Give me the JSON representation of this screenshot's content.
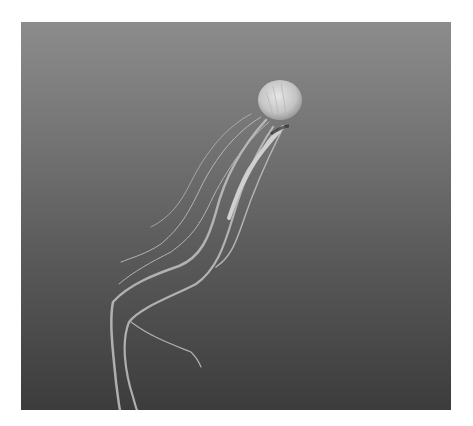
{
  "image": {
    "subject": "jellyfish",
    "alt": "A jellyfish with long trailing tentacles drifting in dark water, grayscale",
    "colors": {
      "background": "#ffffff",
      "water_top": "#8c8c8c",
      "water_bottom": "#3c3c3c",
      "bell": "#d8d8d8",
      "tentacle": "#bdbdbd"
    }
  }
}
